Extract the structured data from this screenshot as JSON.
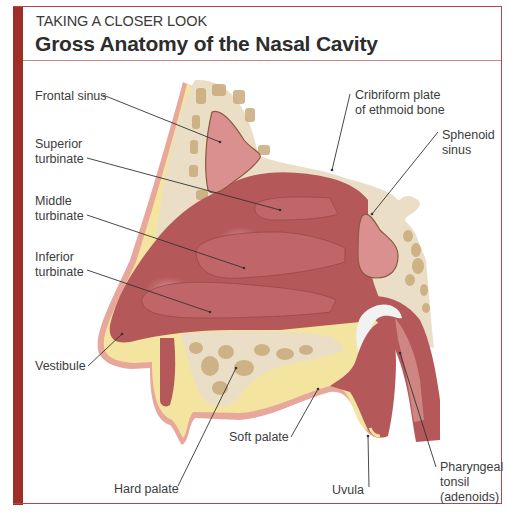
{
  "header": {
    "kicker": "TAKING A CLOSER LOOK",
    "title": "Gross Anatomy of the Nasal Cavity"
  },
  "labels": {
    "frontal_sinus": "Frontal sinus",
    "superior_turbinate": "Superior\nturbinate",
    "middle_turbinate": "Middle\nturbinate",
    "inferior_turbinate": "Inferior\nturbinate",
    "vestibule": "Vestibule",
    "hard_palate": "Hard palate",
    "soft_palate": "Soft palate",
    "uvula": "Uvula",
    "pharyngeal_tonsil": "Pharyngeal\ntonsil\n(adenoids)",
    "cribriform_plate": "Cribriform plate\nof ethmoid bone",
    "sphenoid_sinus": "Sphenoid\nsinus"
  },
  "colors": {
    "frame_bar": "#9e2f28",
    "frame_line": "#b5474a",
    "mucosa": "#b5585a",
    "mucosa_light": "#c9797a",
    "sinus": "#d9908e",
    "bone": "#eadfc6",
    "cancellous": "#c9ab7c",
    "skin_fat": "#f3e4a0",
    "skin_edge": "#e8a79b"
  }
}
